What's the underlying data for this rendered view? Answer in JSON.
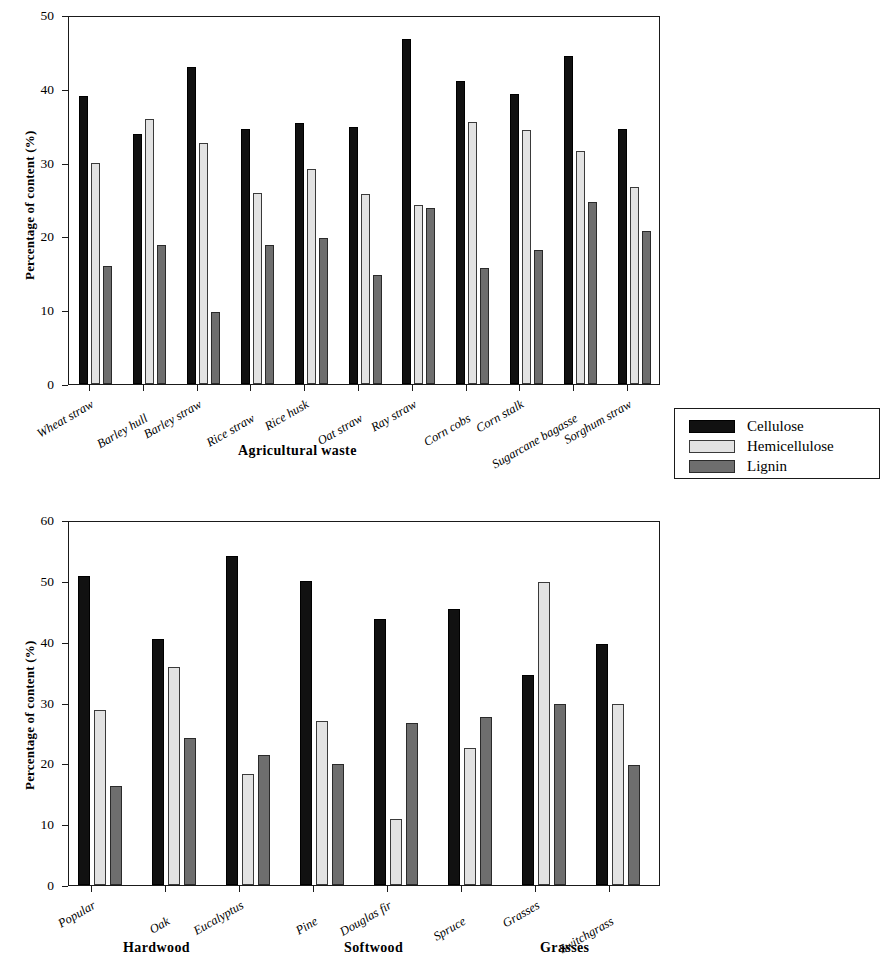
{
  "chart_data": [
    {
      "type": "bar",
      "title": "",
      "xlabel": "Agricultural waste",
      "ylabel": "Percentage of content (%)",
      "ylim": [
        0,
        50
      ],
      "yticks": [
        0,
        10,
        20,
        30,
        40,
        50
      ],
      "grid": false,
      "legend": [
        "Cellulose",
        "Hemicellulose",
        "Lignin"
      ],
      "legend_position": "outside-right",
      "categories": [
        "Wheat straw",
        "Barley hull",
        "Barley straw",
        "Rice straw",
        "Rice husk",
        "Oat straw",
        "Ray straw",
        "Corn cobs",
        "Corn stalk",
        "Sugarcane bagasse",
        "Sorghum straw"
      ],
      "series": [
        {
          "name": "Cellulose",
          "color": "#111111",
          "values": [
            39.0,
            33.9,
            42.9,
            34.5,
            35.4,
            34.8,
            46.7,
            41.0,
            39.3,
            44.5,
            34.6
          ]
        },
        {
          "name": "Hemicellulose",
          "color": "#e2e2e2",
          "values": [
            29.9,
            35.9,
            32.7,
            25.9,
            29.2,
            25.8,
            24.2,
            35.5,
            34.4,
            31.6,
            26.7
          ]
        },
        {
          "name": "Lignin",
          "color": "#6e6e6e",
          "values": [
            16.0,
            18.8,
            9.7,
            18.8,
            19.8,
            14.8,
            23.8,
            15.7,
            18.2,
            24.6,
            20.7
          ]
        }
      ]
    },
    {
      "type": "bar",
      "title": "",
      "xlabel": "",
      "ylabel": "Percentage of content (%)",
      "ylim": [
        0,
        60
      ],
      "yticks": [
        0,
        10,
        20,
        30,
        40,
        50,
        60
      ],
      "grid": false,
      "legend": [
        "Cellulose",
        "Hemicellulose",
        "Lignin"
      ],
      "legend_position": "shared-with-chart-1",
      "categories": [
        "Popular",
        "Oak",
        "Eucalyptus",
        "Pine",
        "Douglas fir",
        "Spruce",
        "Grasses",
        "Switchgrass"
      ],
      "groups": [
        {
          "label": "Hardwood",
          "members": [
            "Popular",
            "Oak",
            "Eucalyptus"
          ]
        },
        {
          "label": "Softwood",
          "members": [
            "Pine",
            "Douglas fir",
            "Spruce"
          ]
        },
        {
          "label": "Grasses",
          "members": [
            "Grasses",
            "Switchgrass"
          ]
        }
      ],
      "series": [
        {
          "name": "Cellulose",
          "color": "#111111",
          "values": [
            50.8,
            40.4,
            54.1,
            49.9,
            43.8,
            45.3,
            34.6,
            39.7
          ]
        },
        {
          "name": "Hemicellulose",
          "color": "#e2e2e2",
          "values": [
            28.7,
            35.9,
            18.2,
            26.9,
            10.8,
            22.6,
            49.8,
            29.7
          ]
        },
        {
          "name": "Lignin",
          "color": "#6e6e6e",
          "values": [
            16.3,
            24.1,
            21.4,
            19.9,
            26.7,
            27.7,
            29.8,
            19.8
          ]
        }
      ]
    }
  ],
  "chart1": {
    "ylabel": "Percentage of content (%)",
    "xlabel": "Agricultural waste",
    "yticks": [
      "50",
      "40",
      "30",
      "20",
      "10",
      "0"
    ]
  },
  "chart2": {
    "ylabel": "Percentage of content (%)",
    "yticks": [
      "60",
      "50",
      "40",
      "30",
      "20",
      "10",
      "0"
    ],
    "group_labels": [
      "Hardwood",
      "Softwood",
      "Grasses"
    ]
  },
  "legend": {
    "items": [
      {
        "label": "Cellulose",
        "swatch": "cellulose"
      },
      {
        "label": "Hemicellulose",
        "swatch": "hemicellulose"
      },
      {
        "label": "Lignin",
        "swatch": "lignin"
      }
    ]
  }
}
